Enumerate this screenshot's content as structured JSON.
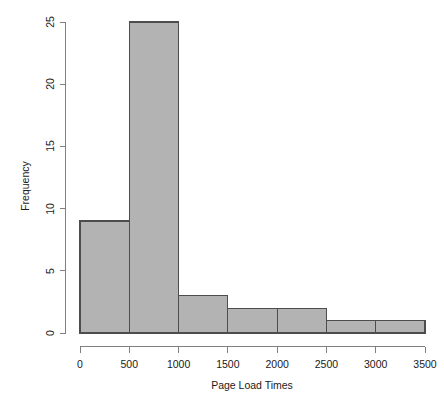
{
  "chart_data": {
    "type": "bar",
    "subtype": "histogram",
    "title": "",
    "xlabel": "Page Load Times",
    "ylabel": "Frequency",
    "categories": [
      "0-500",
      "500-1000",
      "1000-1500",
      "1500-2000",
      "2000-2500",
      "2500-3000",
      "3000-3500"
    ],
    "bin_edges": [
      0,
      500,
      1000,
      1500,
      2000,
      2500,
      3000,
      3500
    ],
    "bin_width": 500,
    "values": [
      9,
      25,
      3,
      2,
      2,
      1,
      1
    ],
    "xlim": [
      0,
      3500
    ],
    "ylim": [
      0,
      25
    ],
    "xticks": [
      0,
      500,
      1000,
      1500,
      2000,
      2500,
      3000,
      3500
    ],
    "xtick_labels": [
      "0",
      "500",
      "1000",
      "1500",
      "2000",
      "2500",
      "3000",
      "3500"
    ],
    "yticks": [
      0,
      5,
      10,
      15,
      20,
      25
    ],
    "ytick_labels": [
      "0",
      "5",
      "10",
      "15",
      "20",
      "25"
    ],
    "grid": false,
    "legend": false,
    "bar_fill_color": "#b3b3b3",
    "bar_border_color": "#4d4d4d",
    "axis_color": "#808080",
    "background_color": "#ffffff",
    "text_color": "#1a1a1a"
  }
}
